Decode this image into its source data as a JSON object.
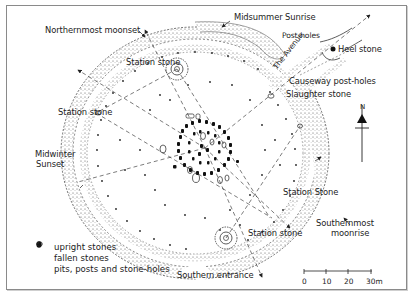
{
  "diagram": {
    "labels": {
      "northernmost_moonset": "Northernmost moonset",
      "midsummer_sunrise": "Midsummer Sunrise",
      "post_holes": "Post-holes",
      "heel_stone": "Heel stone",
      "the_avenue": "The Avenue",
      "causeway_post_holes": "Causeway post-holes",
      "slaughter_stone": "Slaughter stone",
      "station_stone_nw": "Station stone",
      "station_stone_w": "Station stone",
      "station_stone_se": "Station Stone",
      "station_stone_s": "Station stone",
      "midwinter_sunset_line1": "Midwinter",
      "midwinter_sunset_line2": "Sunset",
      "southernmost_moonrise_line1": "Southernmost",
      "southernmost_moonrise_line2": "moonrise",
      "southern_entrance": "Southern entrance"
    },
    "north_arrow": {
      "label": "N",
      "icon": "north-arrow-icon"
    },
    "scale_bar": {
      "ticks": [
        "0",
        "10",
        "20",
        "30m"
      ]
    },
    "legend": [
      {
        "icon": "filled-stone-icon",
        "label": "upright stones"
      },
      {
        "icon": "outline-stone-icon",
        "label": "fallen stones"
      },
      {
        "icon": "dot-icon",
        "label": "pits, posts and stone-holes"
      }
    ],
    "colors": {
      "ink": "#222222",
      "stipple": "#555555",
      "frame": "#8a8a8a",
      "background": "#ffffff"
    }
  }
}
